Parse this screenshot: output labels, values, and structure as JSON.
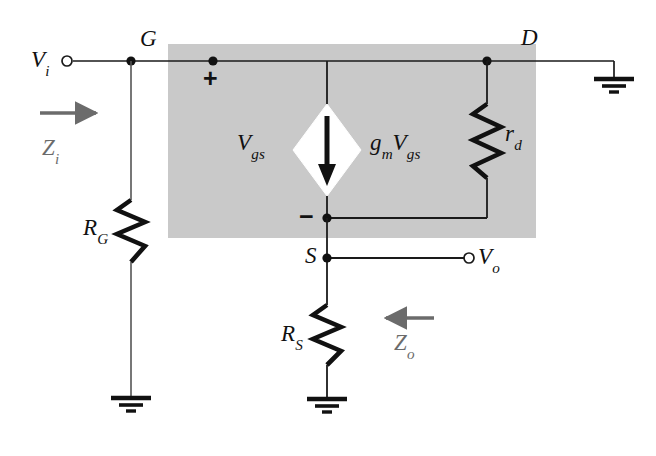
{
  "figure": {
    "type": "circuit-schematic",
    "background_color": "#ffffff",
    "shaded_block_color": "#c9c9c9",
    "wire_color": "#1a1a1a",
    "annotation_color": "#6b6b6b"
  },
  "terminals": {
    "input": {
      "label": "V",
      "sub": "i"
    },
    "output": {
      "label": "V",
      "sub": "o"
    }
  },
  "nodes": {
    "gate": {
      "label": "G"
    },
    "drain": {
      "label": "D"
    },
    "source": {
      "label": "S"
    }
  },
  "components": {
    "gate_resistor": {
      "label": "R",
      "sub": "G"
    },
    "source_resistor": {
      "label": "R",
      "sub": "S"
    },
    "drain_resistance": {
      "label": "r",
      "sub": "d"
    },
    "current_source": {
      "label_lead": "g",
      "label_lead_sub": "m",
      "label_main": "V",
      "label_main_sub": "gs",
      "direction": "down"
    },
    "gate_source_voltage": {
      "label": "V",
      "sub": "gs"
    }
  },
  "polarity": {
    "plus": "+",
    "minus": "−"
  },
  "impedances": {
    "input_impedance": {
      "label": "Z",
      "sub": "i",
      "arrow": "right"
    },
    "output_impedance": {
      "label": "Z",
      "sub": "o",
      "arrow": "left"
    }
  },
  "grounds": [
    {
      "name": "gate-ground"
    },
    {
      "name": "drain-ground"
    },
    {
      "name": "source-ground"
    }
  ]
}
